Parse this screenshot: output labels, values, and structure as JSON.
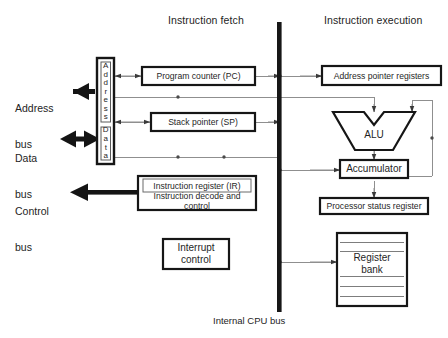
{
  "diagram": {
    "headings": {
      "fetch": "Instruction fetch",
      "execution": "Instruction execution"
    },
    "bus_caption": "Internal CPU bus",
    "external_buses": [
      {
        "id": "address-bus",
        "line1": "Address",
        "line2": "bus",
        "arrow": "left"
      },
      {
        "id": "data-bus",
        "line1": "Data",
        "line2": "bus",
        "arrow": "both"
      },
      {
        "id": "control-bus",
        "line1": "Control",
        "line2": "bus",
        "arrow": "left"
      }
    ],
    "buffers": [
      {
        "id": "address-buffer",
        "letters": [
          "A",
          "d",
          "d",
          "r",
          "e",
          "s",
          "s"
        ]
      },
      {
        "id": "data-buffer",
        "letters": [
          "D",
          "a",
          "t",
          "a"
        ]
      }
    ],
    "blocks": {
      "program_counter": "Program counter (PC)",
      "stack_pointer": "Stack pointer (SP)",
      "instruction_register": "Instruction register (IR)",
      "instruction_decode": "Instruction decode and\ncontrol",
      "interrupt_control": "Interrupt\ncontrol",
      "address_pointer_registers": "Address pointer registers",
      "alu": "ALU",
      "accumulator": "Accumulator",
      "processor_status_register": "Processor status register",
      "register_bank": "Register\nbank"
    },
    "colors": {
      "ink": "#1f1f1f",
      "line": "#8a8a8a",
      "heavy": "#1a1a1a",
      "paper": "#ffffff"
    }
  }
}
